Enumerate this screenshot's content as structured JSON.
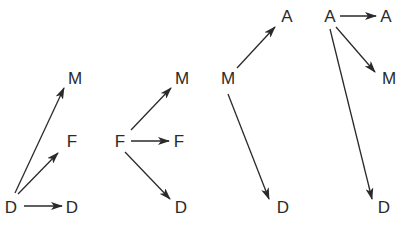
{
  "diagram": {
    "type": "directed-graph-panels",
    "colors": {
      "stroke": "#2a2a2a",
      "background": "#ffffff"
    },
    "panels": [
      {
        "id": "panel-d",
        "source": "D",
        "nodes": [
          {
            "id": "d-src",
            "label": "D",
            "x": 11,
            "y": 207
          },
          {
            "id": "d-d",
            "label": "D",
            "x": 72,
            "y": 207
          },
          {
            "id": "d-f",
            "label": "F",
            "x": 72,
            "y": 141
          },
          {
            "id": "d-m",
            "label": "M",
            "x": 75,
            "y": 78
          }
        ],
        "edges": [
          {
            "from": "d-src",
            "to": "d-d",
            "x1": 24,
            "y1": 206,
            "x2": 62,
            "y2": 206
          },
          {
            "from": "d-src",
            "to": "d-f",
            "x1": 18,
            "y1": 194,
            "x2": 58,
            "y2": 153
          },
          {
            "from": "d-src",
            "to": "d-m",
            "x1": 15,
            "y1": 193,
            "x2": 64,
            "y2": 88
          }
        ]
      },
      {
        "id": "panel-f",
        "source": "F",
        "nodes": [
          {
            "id": "f-src",
            "label": "F",
            "x": 120,
            "y": 141
          },
          {
            "id": "f-f",
            "label": "F",
            "x": 179,
            "y": 141
          },
          {
            "id": "f-m",
            "label": "M",
            "x": 182,
            "y": 78
          },
          {
            "id": "f-d",
            "label": "D",
            "x": 181,
            "y": 207
          }
        ],
        "edges": [
          {
            "from": "f-src",
            "to": "f-f",
            "x1": 131,
            "y1": 141,
            "x2": 169,
            "y2": 141
          },
          {
            "from": "f-src",
            "to": "f-m",
            "x1": 131,
            "y1": 130,
            "x2": 171,
            "y2": 88
          },
          {
            "from": "f-src",
            "to": "f-d",
            "x1": 125,
            "y1": 152,
            "x2": 170,
            "y2": 199
          }
        ]
      },
      {
        "id": "panel-m",
        "source": "M",
        "nodes": [
          {
            "id": "m-src",
            "label": "M",
            "x": 228,
            "y": 78
          },
          {
            "id": "m-a",
            "label": "A",
            "x": 287,
            "y": 16
          },
          {
            "id": "m-d",
            "label": "D",
            "x": 283,
            "y": 207
          }
        ],
        "edges": [
          {
            "from": "m-src",
            "to": "m-a",
            "x1": 237,
            "y1": 68,
            "x2": 275,
            "y2": 27
          },
          {
            "from": "m-src",
            "to": "m-d",
            "x1": 228,
            "y1": 94,
            "x2": 269,
            "y2": 199
          }
        ]
      },
      {
        "id": "panel-a",
        "source": "A",
        "nodes": [
          {
            "id": "a-src",
            "label": "A",
            "x": 330,
            "y": 16
          },
          {
            "id": "a-a",
            "label": "A",
            "x": 386,
            "y": 16
          },
          {
            "id": "a-m",
            "label": "M",
            "x": 389,
            "y": 78
          },
          {
            "id": "a-d",
            "label": "D",
            "x": 384,
            "y": 207
          }
        ],
        "edges": [
          {
            "from": "a-src",
            "to": "a-a",
            "x1": 340,
            "y1": 16,
            "x2": 376,
            "y2": 16
          },
          {
            "from": "a-src",
            "to": "a-m",
            "x1": 336,
            "y1": 27,
            "x2": 375,
            "y2": 72
          },
          {
            "from": "a-src",
            "to": "a-d",
            "x1": 330,
            "y1": 29,
            "x2": 372,
            "y2": 199
          }
        ]
      }
    ]
  }
}
